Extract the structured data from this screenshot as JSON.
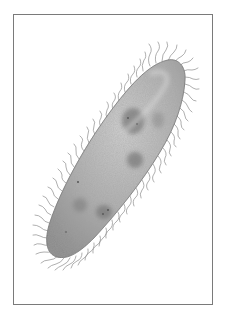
{
  "image": {
    "subject": "paramecium",
    "description": "Illustration of a ciliated single-celled organism (paramecium) within a thin gray rectangular frame",
    "colors": {
      "background": "#ffffff",
      "frame": "#7a7a7a",
      "body_light": "#c9c9c9",
      "body_mid": "#a8a8a8",
      "body_dark": "#808080",
      "nucleus": "#6e6e6e",
      "cilia": "#8c8c8c"
    }
  }
}
